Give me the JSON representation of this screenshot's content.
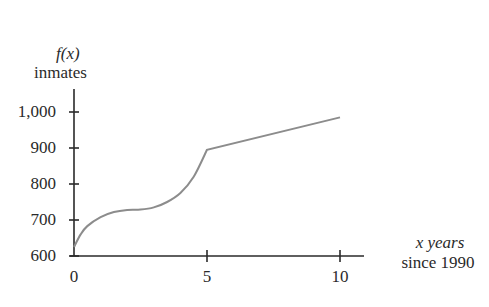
{
  "chart_data": {
    "type": "line",
    "title": "",
    "ylabel_line1": "f(x)",
    "ylabel_line2": "inmates",
    "xlabel_line1": "x years",
    "xlabel_line2": "since 1990",
    "xlim": [
      0,
      10
    ],
    "ylim": [
      600,
      1050
    ],
    "x_ticks": [
      0,
      5,
      10
    ],
    "x_tick_labels": [
      "0",
      "5",
      "10"
    ],
    "y_ticks": [
      600,
      700,
      800,
      900,
      1000
    ],
    "y_tick_labels": [
      "600",
      "700",
      "800",
      "900",
      "1,000"
    ],
    "grid": false,
    "legend": null,
    "series": [
      {
        "name": "f(x)",
        "color": "#8c8c8c",
        "x": [
          0,
          0.25,
          0.5,
          1,
          1.5,
          2,
          2.5,
          3,
          3.5,
          4,
          4.5,
          5,
          10
        ],
        "y": [
          625,
          660,
          683,
          708,
          722,
          728,
          729,
          735,
          750,
          775,
          820,
          895,
          985
        ]
      }
    ]
  }
}
